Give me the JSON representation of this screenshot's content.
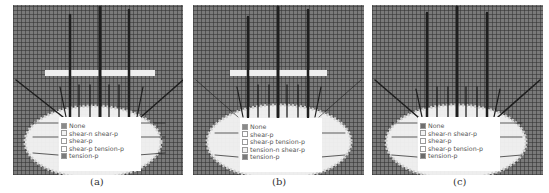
{
  "figure": {
    "panels": [
      {
        "id": "a",
        "caption": "(a)",
        "has_bar": true,
        "legend": [
          {
            "label": "None",
            "color": "#8a8a8a"
          },
          {
            "label": "shear-n shear-p",
            "color": "#f2f2f2"
          },
          {
            "label": "shear-p",
            "color": "#ffffff"
          },
          {
            "label": "shear-p tension-p",
            "color": "#ffffff"
          },
          {
            "label": "tension-p",
            "color": "#7a7a7a"
          }
        ]
      },
      {
        "id": "b",
        "caption": "(b)",
        "has_bar": true,
        "legend": [
          {
            "label": "None",
            "color": "#8a8a8a"
          },
          {
            "label": "shear-p",
            "color": "#ffffff"
          },
          {
            "label": "shear-p tension-p",
            "color": "#ffffff"
          },
          {
            "label": "tension-n shear-p",
            "color": "#f2f2f2"
          },
          {
            "label": "tension-p",
            "color": "#7a7a7a"
          }
        ]
      },
      {
        "id": "c",
        "caption": "(c)",
        "has_bar": false,
        "legend": [
          {
            "label": "None",
            "color": "#6f6f6f"
          },
          {
            "label": "shear-n shear-p",
            "color": "#f2f2f2"
          },
          {
            "label": "shear-p",
            "color": "#ffffff"
          },
          {
            "label": "shear-p tension-p",
            "color": "#ffffff"
          },
          {
            "label": "tension-p",
            "color": "#6a6a6a"
          }
        ]
      }
    ],
    "colors": {
      "grid_background": "#7a7a7a",
      "plastic_zone": "#f4f4f4",
      "bolt_lines": "#1e1e1e"
    }
  }
}
